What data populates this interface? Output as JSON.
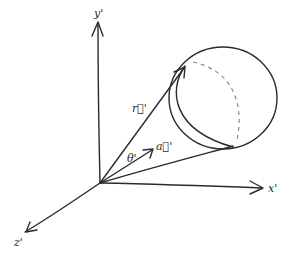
{
  "diagram": {
    "title": "",
    "axes": {
      "y": {
        "label": "y'"
      },
      "x": {
        "label": "x'"
      },
      "z": {
        "label": "z'"
      }
    },
    "vectors": {
      "r": {
        "label": "r⃗'"
      },
      "a": {
        "label": "a⃗'"
      }
    },
    "angle": {
      "label": "θ'"
    },
    "colors": {
      "ink": "#2a2a2a",
      "hidden": "#8a8a8a"
    }
  }
}
